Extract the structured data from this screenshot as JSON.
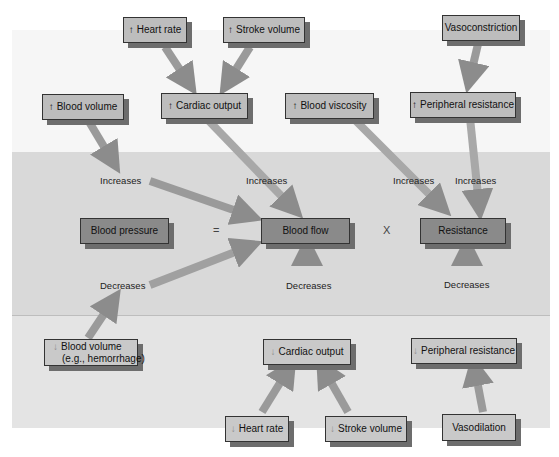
{
  "diagram": {
    "bands": [
      "top",
      "middle",
      "bottom"
    ],
    "equation": {
      "left": "Blood pressure",
      "equals": "=",
      "middle": "Blood flow",
      "times": "X",
      "right": "Resistance"
    },
    "increases_factors": {
      "heart_rate": {
        "arrow": "↑",
        "label": "Heart rate"
      },
      "stroke_volume": {
        "arrow": "↑",
        "label": "Stroke volume"
      },
      "cardiac_output": {
        "arrow": "↑",
        "label": "Cardiac output"
      },
      "blood_volume": {
        "arrow": "↑",
        "label": "Blood volume"
      },
      "blood_viscosity": {
        "arrow": "↑",
        "label": "Blood viscosity"
      },
      "vasoconstriction": {
        "label": "Vasoconstriction"
      },
      "peripheral_resistance": {
        "arrow": "↑",
        "label": "Peripheral resistance"
      }
    },
    "decreases_factors": {
      "blood_volume_line1": {
        "arrow": "↓",
        "label": "Blood volume"
      },
      "blood_volume_line2": "(e.g., hemorrhage)",
      "cardiac_output": {
        "arrow": "↓",
        "label": "Cardiac output"
      },
      "peripheral_resistance": {
        "arrow": "↓",
        "label": "Peripheral resistance"
      },
      "heart_rate": {
        "arrow": "↓",
        "label": "Heart rate"
      },
      "stroke_volume": {
        "arrow": "↓",
        "label": "Stroke volume"
      },
      "vasodilation": {
        "label": "Vasodilation"
      }
    },
    "edge_labels": {
      "increases_1": "Increases",
      "increases_2": "Increases",
      "increases_3": "Increases",
      "increases_4": "Increases",
      "decreases_1": "Decreases",
      "decreases_2": "Decreases",
      "decreases_3": "Decreases"
    },
    "colors": {
      "band_top": "#f6f6f6",
      "band_middle": "#d9d9d9",
      "band_bottom": "#e4e4e4",
      "box_light": "#bdbdbd",
      "box_dark": "#8a8a8a",
      "arrow": "#8c8c8c",
      "shadow": "#6d6d6d"
    }
  }
}
